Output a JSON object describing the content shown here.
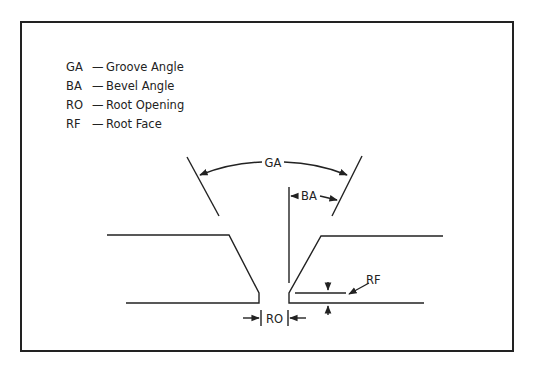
{
  "diagram": {
    "legend": [
      {
        "abbr": "GA",
        "sep": "—",
        "text": "Groove Angle"
      },
      {
        "abbr": "BA",
        "sep": "—",
        "text": "Bevel Angle"
      },
      {
        "abbr": "RO",
        "sep": "—",
        "text": "Root Opening"
      },
      {
        "abbr": "RF",
        "sep": "—",
        "text": "Root Face"
      }
    ],
    "labels": {
      "groove_angle": "GA",
      "bevel_angle": "BA",
      "root_opening": "RO",
      "root_face": "RF"
    },
    "colors": {
      "line": "#222222",
      "background": "#ffffff"
    }
  }
}
